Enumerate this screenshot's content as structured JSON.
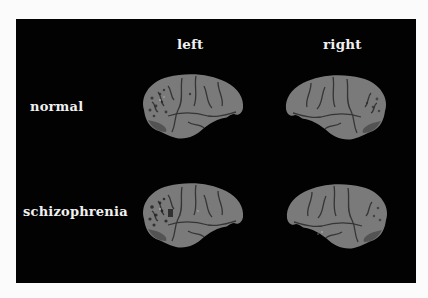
{
  "figure": {
    "columns": [
      {
        "label": "left"
      },
      {
        "label": "right"
      }
    ],
    "rows": [
      {
        "label": "normal"
      },
      {
        "label": "schizophrenia"
      }
    ],
    "panels": [
      {
        "row": "normal",
        "hemisphere": "left"
      },
      {
        "row": "normal",
        "hemisphere": "right"
      },
      {
        "row": "schizophrenia",
        "hemisphere": "left"
      },
      {
        "row": "schizophrenia",
        "hemisphere": "right"
      }
    ],
    "colors": {
      "background": "#020202",
      "page": "#fbfbfb",
      "brain_fill": "#7a7a7a",
      "sulci": "#2a2a2a",
      "text": "#f0f0f0"
    }
  }
}
